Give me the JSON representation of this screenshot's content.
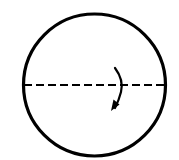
{
  "diagram": {
    "circle": {
      "cx": 94.5,
      "cy": 85,
      "r": 71,
      "stroke": "#000000",
      "stroke_width": 3.2
    },
    "axis": {
      "x1": 24,
      "x2": 165,
      "y": 85,
      "dash": "8 4",
      "stroke": "#000000",
      "stroke_width": 2.2
    },
    "rotation_arrow": {
      "direction": "downward-curving",
      "stroke": "#000000"
    }
  }
}
